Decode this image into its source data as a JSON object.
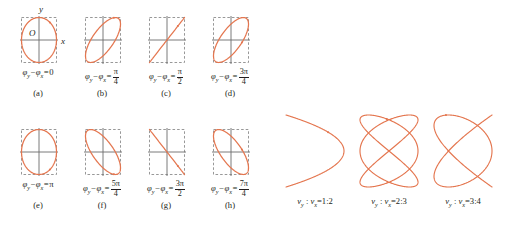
{
  "figure": {
    "top_truncated_text": "",
    "curve_color": "#e4764f",
    "axis_color": "#6b6b6b",
    "box_color": "#8c8c8c",
    "text_color": "#231f20"
  },
  "phase_panels": {
    "axis_labels": {
      "y": "y",
      "x": "x",
      "origin": "O"
    },
    "lhs": "φ",
    "sub_y": "y",
    "sub_x": "x",
    "minus": "−",
    "equals": "=",
    "items": [
      {
        "tag": "(a)",
        "value_text": "0",
        "value_num": "",
        "value_den": "",
        "shape": "line-pos",
        "phase_deg": 0
      },
      {
        "tag": "(b)",
        "value_text": "",
        "value_num": "π",
        "value_den": "4",
        "shape": "ellipse-pos-narrow",
        "phase_deg": 45
      },
      {
        "tag": "(c)",
        "value_text": "",
        "value_num": "π",
        "value_den": "2",
        "shape": "ellipse-upright",
        "phase_deg": 90
      },
      {
        "tag": "(d)",
        "value_text": "",
        "value_num": "3π",
        "value_den": "4",
        "shape": "ellipse-neg-narrow",
        "phase_deg": 135
      },
      {
        "tag": "(e)",
        "value_text": "π",
        "value_num": "",
        "value_den": "",
        "shape": "line-neg",
        "phase_deg": 180
      },
      {
        "tag": "(f)",
        "value_text": "",
        "value_num": "5π",
        "value_den": "4",
        "shape": "ellipse-neg-narrow",
        "phase_deg": 225
      },
      {
        "tag": "(g)",
        "value_text": "",
        "value_num": "3π",
        "value_den": "2",
        "shape": "ellipse-upright",
        "phase_deg": 270
      },
      {
        "tag": "(h)",
        "value_text": "",
        "value_num": "7π",
        "value_den": "4",
        "shape": "ellipse-pos-narrow",
        "phase_deg": 315
      }
    ]
  },
  "lissajous": {
    "symbol": "ν",
    "sub_y": "y",
    "sub_x": "x",
    "colon": " : ",
    "equals": "=",
    "items": [
      {
        "ratio_text": "1:2",
        "ny": 1,
        "nx": 2,
        "phase": 1.5707963
      },
      {
        "ratio_text": "2:3",
        "ny": 2,
        "nx": 3,
        "phase": 1.5707963
      },
      {
        "ratio_text": "3:4",
        "ny": 3,
        "nx": 4,
        "phase": 1.5707963
      }
    ]
  }
}
